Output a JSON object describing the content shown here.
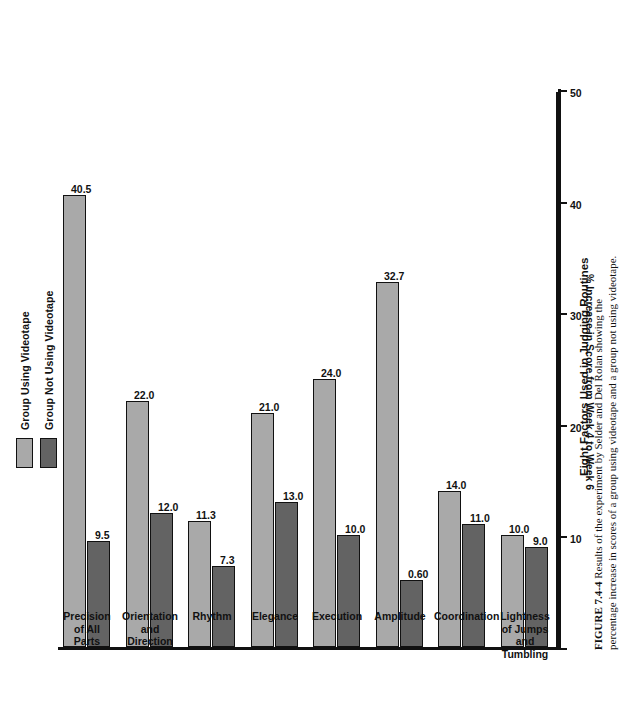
{
  "legend": {
    "items": [
      {
        "label": "Group Using Videotape",
        "color": "#a9a9a9"
      },
      {
        "label": "Group Not Using Videotape",
        "color": "#636363"
      }
    ]
  },
  "axis": {
    "value_title": "% Increase in Score from Week 4 to Week 6",
    "value_ticks": [
      "0",
      "10",
      "20",
      "30",
      "40",
      "50"
    ],
    "category_title": "Eight Factors Used in Judging Routines"
  },
  "caption": {
    "figure_number": "FIGURE 7.4-4",
    "text": "Results of the experiment by Selder and Del Rolan showing the percentage increase in scores of a group using videotape and a group not using videotape."
  },
  "chart_data": {
    "type": "bar",
    "title": "Eight Factors Used in Judging Routines",
    "xlabel": "Eight Factors Used in Judging Routines",
    "ylabel": "% Increase in Score from Week 4 to Week 6",
    "ylim": [
      0,
      50
    ],
    "grid": false,
    "legend_position": "top-left",
    "orientation": "horizontal-printed-sideways",
    "categories": [
      "Precision\nof All\nParts",
      "Orientation\nand Direction",
      "Rhythm",
      "Elegance",
      "Execution",
      "Amplitude",
      "Coordination",
      "Lightness\nof Jumps and\nTumbling"
    ],
    "series": [
      {
        "name": "Group Using Videotape",
        "color": "#a9a9a9",
        "values": [
          40.5,
          22.0,
          11.3,
          21.0,
          24.0,
          32.7,
          14.0,
          10.0
        ],
        "labels": [
          "40.5",
          "22.0",
          "11.3",
          "21.0",
          "24.0",
          "32.7",
          "14.0",
          "10.0"
        ]
      },
      {
        "name": "Group Not Using Videotape",
        "color": "#636363",
        "values": [
          9.5,
          12.0,
          7.3,
          13.0,
          10.0,
          0.6,
          11.0,
          9.0
        ],
        "labels": [
          "9.5",
          "12.0",
          "7.3",
          "13.0",
          "10.0",
          "0.60",
          "11.0",
          "9.0"
        ],
        "drawn_lengths": [
          9.5,
          12.0,
          7.3,
          13.0,
          10.0,
          6.0,
          11.0,
          9.0
        ]
      }
    ]
  }
}
